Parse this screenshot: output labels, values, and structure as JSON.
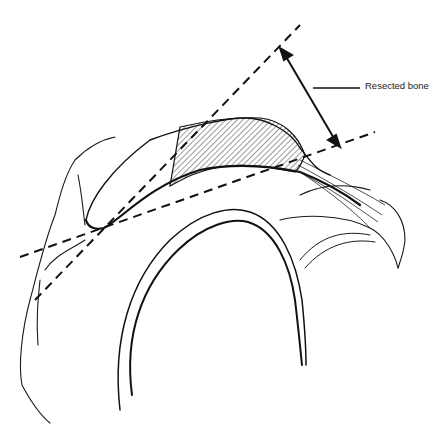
{
  "figure": {
    "annotations": [
      {
        "id": "resected-bone",
        "label": "Resected bone"
      }
    ],
    "colors": {
      "ink": "#111111",
      "background": "#ffffff"
    }
  }
}
